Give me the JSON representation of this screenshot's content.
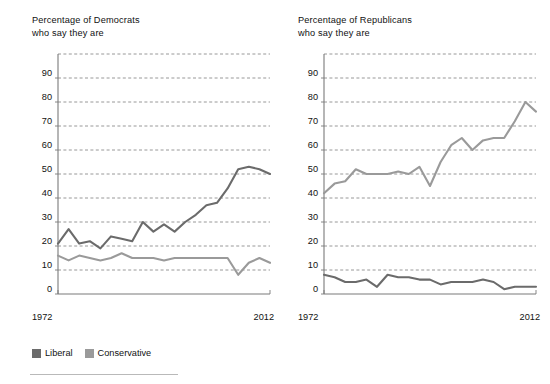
{
  "legend": {
    "items": [
      {
        "label": "Liberal",
        "color": "#6b6b6b",
        "key": "liberal"
      },
      {
        "label": "Conservative",
        "color": "#9a9a9a",
        "key": "conservative"
      }
    ]
  },
  "colors": {
    "liberal": "#6b6b6b",
    "conservative": "#9a9a9a",
    "axis": "#7a7a7a",
    "grid": "#8d8d8d",
    "text": "#111111",
    "footer_rule": "#b9b9b9",
    "background": "#ffffff"
  },
  "axis": {
    "y_ticks": [
      "0",
      "10",
      "20",
      "30",
      "40",
      "50",
      "60",
      "70",
      "80",
      "90"
    ],
    "y_min": 0,
    "y_max": 100,
    "x_start_label": "1972",
    "x_end_label": "2012"
  },
  "chart_data": [
    {
      "type": "line",
      "id": "democrats",
      "title": "Percentage of Democrats\nwho say they are",
      "title_line1": "Percentage of Democrats",
      "title_line2": "who say they are",
      "xlabel": "",
      "ylabel": "",
      "xlim": [
        1972,
        2012
      ],
      "ylim": [
        0,
        100
      ],
      "grid": true,
      "legend_position": "below-left",
      "x": [
        1972,
        1974,
        1976,
        1978,
        1980,
        1982,
        1984,
        1986,
        1988,
        1990,
        1992,
        1994,
        1996,
        1998,
        2000,
        2002,
        2004,
        2006,
        2008,
        2010,
        2012
      ],
      "xtick_labels": [
        "1972",
        "2012"
      ],
      "series": [
        {
          "name": "Liberal",
          "color": "#6b6b6b",
          "values": [
            21,
            27,
            21,
            22,
            19,
            24,
            23,
            22,
            30,
            26,
            29,
            26,
            30,
            33,
            37,
            38,
            44,
            52,
            53,
            52,
            50
          ]
        },
        {
          "name": "Conservative",
          "color": "#9a9a9a",
          "values": [
            16,
            14,
            16,
            15,
            14,
            15,
            17,
            15,
            15,
            15,
            14,
            15,
            15,
            15,
            15,
            15,
            15,
            8,
            13,
            15,
            13
          ]
        }
      ]
    },
    {
      "type": "line",
      "id": "republicans",
      "title": "Percentage of Republicans\nwho say they are",
      "title_line1": "Percentage of Republicans",
      "title_line2": "who say they are",
      "xlabel": "",
      "ylabel": "",
      "xlim": [
        1972,
        2012
      ],
      "ylim": [
        0,
        100
      ],
      "grid": true,
      "legend_position": "shared",
      "x": [
        1972,
        1974,
        1976,
        1978,
        1980,
        1982,
        1984,
        1986,
        1988,
        1990,
        1992,
        1994,
        1996,
        1998,
        2000,
        2002,
        2004,
        2006,
        2008,
        2010,
        2012
      ],
      "xtick_labels": [
        "1972",
        "2012"
      ],
      "series": [
        {
          "name": "Conservative",
          "color": "#9a9a9a",
          "values": [
            42,
            46,
            47,
            52,
            50,
            50,
            50,
            51,
            50,
            53,
            45,
            55,
            62,
            65,
            60,
            64,
            65,
            65,
            72,
            80,
            76
          ]
        },
        {
          "name": "Liberal",
          "color": "#6b6b6b",
          "values": [
            8,
            7,
            5,
            5,
            6,
            3,
            8,
            7,
            7,
            6,
            6,
            4,
            5,
            5,
            5,
            6,
            5,
            2,
            3,
            3,
            3
          ]
        }
      ]
    }
  ]
}
